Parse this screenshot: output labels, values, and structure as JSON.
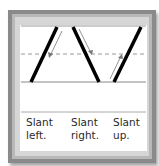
{
  "diagram": {
    "strokes": [
      {
        "id": "slant-left",
        "label_line1": "Slant",
        "label_line2": "left."
      },
      {
        "id": "slant-right",
        "label_line1": "Slant",
        "label_line2": "right."
      },
      {
        "id": "slant-up",
        "label_line1": "Slant",
        "label_line2": "up."
      }
    ],
    "colors": {
      "frame": "#8a8a8a",
      "stroke": "#000000",
      "guide": "#888888",
      "arrow": "#666666"
    }
  }
}
